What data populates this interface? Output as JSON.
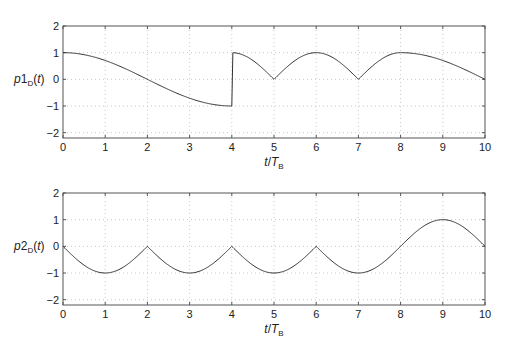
{
  "chart_data": [
    {
      "type": "line",
      "title": "",
      "ylabel": "p1_D(t)",
      "ylabel_parts": {
        "p": "p",
        "num": "1",
        "sub": "D",
        "arg": "(t)"
      },
      "xlabel": "t/T_B",
      "xlabel_parts": {
        "t": "t/",
        "T": "T",
        "sub": "B"
      },
      "xlim": [
        0,
        10
      ],
      "ylim": [
        -2.2,
        2
      ],
      "xticks": [
        "0",
        "1",
        "2",
        "3",
        "4",
        "5",
        "6",
        "7",
        "8",
        "9",
        "10"
      ],
      "yticks": [
        "2",
        "1",
        "0",
        "-1",
        "-2"
      ],
      "grid": true,
      "series": [
        {
          "name": "p1_D",
          "description": "cos(pi t/4) for 0-2 (to -1), rising to +1 at 4; |cos| arches 4-8 with cusps at 0 at t=5,7; falls from +1 at 8 to -1 at 10",
          "x": [
            0,
            1,
            2,
            3,
            4,
            5,
            6,
            7,
            8,
            9,
            10
          ],
          "values": [
            1,
            0,
            -1,
            0,
            1,
            0,
            1,
            0,
            1,
            0,
            -1
          ]
        }
      ]
    },
    {
      "type": "line",
      "title": "",
      "ylabel": "p2_D(t)",
      "ylabel_parts": {
        "p": "p",
        "num": "2",
        "sub": "D",
        "arg": "(t)"
      },
      "xlabel": "t/T_B",
      "xlabel_parts": {
        "t": "t/",
        "T": "T",
        "sub": "B"
      },
      "xlim": [
        0,
        10
      ],
      "ylim": [
        -2.2,
        2
      ],
      "xticks": [
        "0",
        "1",
        "2",
        "3",
        "4",
        "5",
        "6",
        "7",
        "8",
        "9",
        "10"
      ],
      "yticks": [
        "2",
        "1",
        "0",
        "-1",
        "-2"
      ],
      "grid": true,
      "series": [
        {
          "name": "p2_D",
          "description": "-|sin| arches with cusps at 0 at t=2,4,6; minima -1 at 1,3,5,7; smooth rise to +1 at t=9, back to 0 at 10",
          "x": [
            0,
            1,
            2,
            3,
            4,
            5,
            6,
            7,
            8,
            9,
            10
          ],
          "values": [
            0,
            -1,
            0,
            -1,
            0,
            -1,
            0,
            -1,
            0,
            1,
            0
          ]
        }
      ]
    }
  ]
}
